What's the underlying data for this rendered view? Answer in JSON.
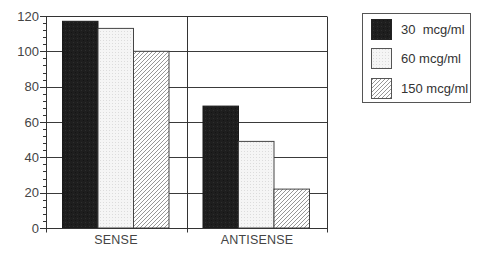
{
  "chart_data": {
    "type": "bar",
    "title": "",
    "xlabel": "",
    "ylabel": "",
    "categories": [
      "SENSE",
      "ANTISENSE"
    ],
    "series": [
      {
        "name": "30  mcg/ml",
        "values": [
          117,
          69
        ],
        "fill": "#1e1e1e",
        "pattern": "solid-black"
      },
      {
        "name": "60 mcg/ml",
        "values": [
          113,
          49
        ],
        "fill": "#f3f3f3",
        "pattern": "light-stipple"
      },
      {
        "name": "150 mcg/ml",
        "values": [
          100,
          22
        ],
        "fill": "#ffffff",
        "pattern": "diagonal-hatch"
      }
    ],
    "ylim": [
      0,
      120
    ],
    "yticks": [
      "0",
      "20",
      "40",
      "60",
      "80",
      "100",
      "120"
    ],
    "minor_tick_step": 4,
    "grid": true,
    "legend_position": "top-right",
    "colors": {
      "axis": "#333333",
      "grid": "#3a3a3a",
      "hatch": "#8a8a8a",
      "text": "#444444"
    }
  }
}
